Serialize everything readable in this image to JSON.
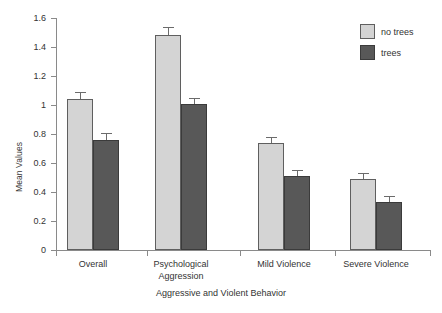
{
  "chart_data": {
    "type": "bar",
    "title": "",
    "xlabel": "Aggressive and Violent Behavior",
    "ylabel": "Mean Values",
    "categories": [
      "Overall",
      "Psychological Aggression",
      "Mild Violence",
      "Severe Violence"
    ],
    "category_label_lines": [
      [
        "Overall"
      ],
      [
        "Psychological",
        "Aggression"
      ],
      [
        "Mild Violence"
      ],
      [
        "Severe Violence"
      ]
    ],
    "series": [
      {
        "name": "no trees",
        "color": "#d4d4d4",
        "values": [
          1.04,
          1.48,
          0.74,
          0.49
        ],
        "errors": [
          0.05,
          0.06,
          0.04,
          0.04
        ]
      },
      {
        "name": "trees",
        "color": "#585858",
        "values": [
          0.76,
          1.01,
          0.51,
          0.33
        ],
        "errors": [
          0.05,
          0.04,
          0.04,
          0.04
        ]
      }
    ],
    "ylim": [
      0,
      1.6
    ],
    "ytick_values": [
      0,
      0.2,
      0.4,
      0.6,
      0.8,
      1.0,
      1.2,
      1.4,
      1.6
    ],
    "ytick_labels": [
      "0",
      "0.2",
      "0.4",
      "0.6",
      "0.8",
      "1",
      "1.2",
      "1.4",
      "1.6"
    ],
    "grid": false,
    "legend_position": "top-right"
  },
  "legend": {
    "entries": [
      {
        "label": "no trees",
        "swatch": "light"
      },
      {
        "label": "trees",
        "swatch": "dark"
      }
    ]
  },
  "axes": {
    "y_title": "Mean Values",
    "x_title": "Aggressive and Violent Behavior"
  }
}
